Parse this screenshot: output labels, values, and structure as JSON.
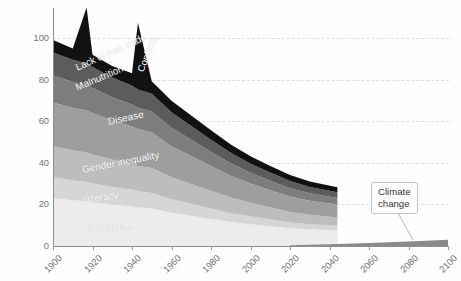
{
  "chart_data": {
    "type": "area",
    "title": "",
    "subtitle": "",
    "xlabel": "",
    "ylabel": "Cost of problem, % global GDP",
    "xlim": [
      1900,
      2100
    ],
    "ylim": [
      0,
      100
    ],
    "y_ticks": [
      0,
      20,
      40,
      60,
      80,
      100
    ],
    "x_ticks": [
      1900,
      1920,
      1940,
      1960,
      1980,
      2000,
      2020,
      2040,
      2060,
      2080,
      2100
    ],
    "grid": "horizontal-dashed",
    "legend": "in-chart-labels",
    "stacked": true,
    "stack_order_bottom_to_top": [
      "Air pollution",
      "Illiteracy",
      "Gender inequality",
      "Disease",
      "Malnutrition",
      "Lack of free trade",
      "Conflicts"
    ],
    "x": [
      1900,
      1910,
      1917,
      1920,
      1930,
      1940,
      1943,
      1950,
      1960,
      1970,
      1980,
      1990,
      2000,
      2010,
      2020,
      2030,
      2044
    ],
    "series": [
      {
        "name": "Air pollution",
        "color": "#ececec",
        "values": [
          23,
          22,
          21.5,
          21,
          20,
          19,
          18.5,
          18,
          16,
          14.5,
          13,
          11.5,
          10.5,
          9.5,
          8.5,
          8,
          7.5
        ]
      },
      {
        "name": "Illiteracy",
        "color": "#d6d6d6",
        "values": [
          10,
          9.5,
          9.3,
          9,
          8.5,
          8,
          7.8,
          7.5,
          6.5,
          5.8,
          5,
          4.3,
          3.8,
          3.3,
          2.8,
          2.5,
          2.2
        ]
      },
      {
        "name": "Gender inequality",
        "color": "#bdbdbd",
        "values": [
          15,
          14.5,
          14.2,
          14,
          13,
          12.5,
          12.2,
          12,
          10.5,
          9.5,
          8.5,
          7.5,
          6.5,
          5.8,
          5,
          4.5,
          4
        ]
      },
      {
        "name": "Disease",
        "color": "#9e9e9e",
        "values": [
          21,
          20.5,
          20.2,
          20,
          19,
          18,
          17.8,
          17.2,
          15,
          13.5,
          12,
          10.5,
          9.2,
          8.2,
          7.5,
          6.8,
          6.2
        ]
      },
      {
        "name": "Malnutrition",
        "color": "#7d7d7d",
        "values": [
          13,
          12.5,
          12.2,
          12,
          11,
          10.5,
          10.2,
          10,
          8.8,
          7.8,
          6.8,
          6,
          5.2,
          4.6,
          4,
          3.6,
          3.2
        ]
      },
      {
        "name": "Lack of free trade",
        "color": "#5c5c5c",
        "values": [
          11,
          10.5,
          10.3,
          10,
          9.5,
          9,
          8.8,
          8.5,
          7.5,
          6.6,
          5.8,
          5,
          4.4,
          3.9,
          3.4,
          3,
          2.7
        ]
      },
      {
        "name": "Conflicts",
        "color": "#111111",
        "values": [
          6,
          5.5,
          27,
          6,
          5.5,
          6,
          32,
          6,
          5.5,
          5,
          4.5,
          4,
          3.6,
          3.2,
          2.9,
          2.6,
          2.4
        ]
      }
    ],
    "total_values": [
      99,
      95,
      114.5,
      92,
      86.5,
      83,
      107.3,
      79.2,
      70.3,
      62.7,
      55.6,
      48.8,
      43.2,
      38.5,
      34.1,
      31,
      28.2
    ],
    "peaks": [
      {
        "label": "World War I",
        "year": 1917,
        "value": 114.5
      },
      {
        "label": "World War II",
        "year": 1943,
        "value": 107.3
      }
    ],
    "climate_change": {
      "name": "Climate change",
      "color": "#8a8a8a",
      "x": [
        2020,
        2040,
        2060,
        2080,
        2100
      ],
      "values": [
        0.4,
        0.9,
        1.5,
        2.2,
        3.0
      ]
    }
  },
  "axis": {
    "y_title": "Cost of problem, % global GDP",
    "y_tick_labels": [
      "100",
      "80",
      "60",
      "40",
      "20",
      "0"
    ],
    "x_tick_labels": [
      "1900",
      "1920",
      "1940",
      "1960",
      "1980",
      "2000",
      "2020",
      "2040",
      "2060",
      "2080",
      "2100"
    ]
  },
  "band_labels": [
    {
      "name": "lack-of-free-trade",
      "text": "Lack of free trade"
    },
    {
      "name": "conflicts",
      "text": "Conflicts"
    },
    {
      "name": "malnutrition",
      "text": "Malnutrition"
    },
    {
      "name": "disease",
      "text": "Disease"
    },
    {
      "name": "gender-inequality",
      "text": "Gender inequality"
    },
    {
      "name": "illiteracy",
      "text": "Illiteracy"
    },
    {
      "name": "air-pollution",
      "text": "Air pollution"
    }
  ],
  "callout": {
    "line1": "Climate",
    "line2": "change"
  },
  "colors": {
    "air_pollution": "#ececec",
    "illiteracy": "#d6d6d6",
    "gender_inequality": "#bdbdbd",
    "disease": "#9e9e9e",
    "malnutrition": "#7d7d7d",
    "free_trade": "#5c5c5c",
    "conflicts": "#111111",
    "climate": "#8a8a8a",
    "axis": "#8e8e8e",
    "grid": "#dedede",
    "tick_text": "#737373"
  }
}
